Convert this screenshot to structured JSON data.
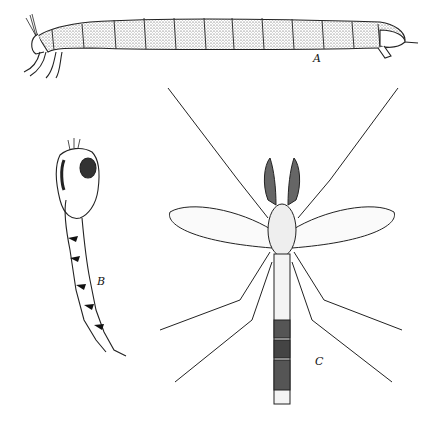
{
  "figure": {
    "panels": [
      {
        "id": "A",
        "label": "A",
        "subject": "larva"
      },
      {
        "id": "B",
        "label": "B",
        "subject": "pupa"
      },
      {
        "id": "C",
        "label": "C",
        "subject": "adult"
      }
    ]
  }
}
